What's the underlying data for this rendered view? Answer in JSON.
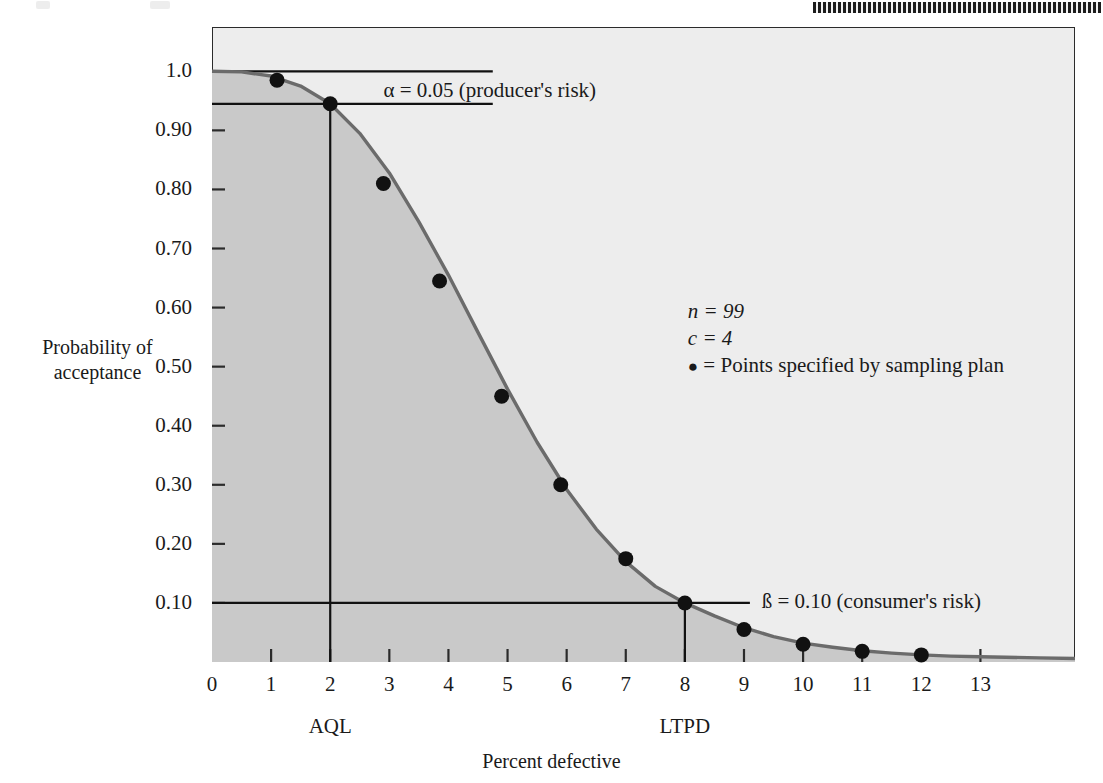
{
  "figure": {
    "axis_title_x": "Percent defective",
    "axis_title_y_line1": "Probability of",
    "axis_title_y_line2": "acceptance"
  },
  "annotations": {
    "alpha": "α = 0.05 (producer's risk)",
    "beta": "ß = 0.10 (consumer's risk)",
    "aql": "AQL",
    "ltpd": "LTPD"
  },
  "legend": {
    "n": "n = 99",
    "c": "c = 4",
    "points_symbol": "●",
    "points_text": "= Points specified by sampling plan"
  },
  "colors": {
    "plot_background": "#ededed",
    "shaded_region": "#c9c9c9",
    "curve": "#6b6b6b",
    "axis": "#2b2b2b",
    "point": "#111111",
    "page_background": "#ffffff"
  },
  "chart_data": {
    "type": "line",
    "title": "",
    "subtitle": "",
    "xlabel": "Percent defective",
    "ylabel": "Probability of acceptance",
    "xlim": [
      0,
      14.6
    ],
    "ylim": [
      0,
      1.075
    ],
    "grid": false,
    "legend_position": "inside-right",
    "xticks": [
      0,
      1,
      2,
      3,
      4,
      5,
      6,
      7,
      8,
      9,
      10,
      11,
      12,
      13
    ],
    "xtick_labels": [
      "0",
      "1",
      "2",
      "3",
      "4",
      "5",
      "6",
      "7",
      "8",
      "9",
      "10",
      "11",
      "12",
      "13"
    ],
    "yticks": [
      0.1,
      0.2,
      0.3,
      0.4,
      0.5,
      0.6,
      0.7,
      0.8,
      0.9,
      1.0
    ],
    "ytick_labels": [
      "0.10",
      "0.20",
      "0.30",
      "0.40",
      "0.50",
      "0.60",
      "0.70",
      "0.80",
      "0.90",
      "1.0"
    ],
    "series": [
      {
        "name": "OC curve",
        "type": "line",
        "x": [
          0,
          0.5,
          1.0,
          1.5,
          2.0,
          2.5,
          3.0,
          3.5,
          4.0,
          4.5,
          5.0,
          5.5,
          6.0,
          6.5,
          7.0,
          7.5,
          8.0,
          8.5,
          9.0,
          9.5,
          10.0,
          10.5,
          11.0,
          11.5,
          12.0,
          12.5,
          13.0,
          14.0,
          14.6
        ],
        "y": [
          1.0,
          0.999,
          0.992,
          0.975,
          0.945,
          0.895,
          0.828,
          0.745,
          0.655,
          0.558,
          0.462,
          0.372,
          0.292,
          0.225,
          0.17,
          0.128,
          0.1,
          0.078,
          0.058,
          0.043,
          0.032,
          0.025,
          0.019,
          0.015,
          0.012,
          0.01,
          0.009,
          0.007,
          0.006
        ]
      },
      {
        "name": "Points specified by sampling plan",
        "type": "scatter",
        "x": [
          1.1,
          2.0,
          2.9,
          3.85,
          4.9,
          5.9,
          7.0,
          8.0,
          9.0,
          10.0,
          11.0,
          12.0
        ],
        "y": [
          0.985,
          0.945,
          0.81,
          0.645,
          0.45,
          0.3,
          0.175,
          0.1,
          0.055,
          0.03,
          0.018,
          0.012
        ]
      }
    ],
    "reference_lines": [
      {
        "name": "probability-1.0-line",
        "orientation": "horizontal",
        "y": 1.0,
        "x_from": 0,
        "x_to": 4.75
      },
      {
        "name": "alpha-line",
        "orientation": "horizontal",
        "y": 0.945,
        "x_from": 0,
        "x_to": 4.75
      },
      {
        "name": "aql-line",
        "orientation": "vertical",
        "x": 2.0,
        "y_from": 0,
        "y_to": 0.945
      },
      {
        "name": "beta-line",
        "orientation": "horizontal",
        "y": 0.1,
        "x_from": 0,
        "x_to": 9.1
      },
      {
        "name": "ltpd-line",
        "orientation": "vertical",
        "x": 8.0,
        "y_from": 0,
        "y_to": 0.1
      }
    ],
    "annotations": [
      {
        "text": "α = 0.05 (producer's risk)",
        "x": 2.9,
        "y": 0.965
      },
      {
        "text": "ß = 0.10 (consumer's risk)",
        "x": 9.3,
        "y": 0.1
      },
      {
        "text": "n = 99",
        "x": 8.1,
        "y": 0.585
      },
      {
        "text": "c = 4",
        "x": 8.1,
        "y": 0.545
      },
      {
        "text": "● = Points specified by sampling plan",
        "x": 8.1,
        "y": 0.505
      },
      {
        "text": "AQL",
        "x": 2.0,
        "y": -0.13
      },
      {
        "text": "LTPD",
        "x": 8.0,
        "y": -0.13
      }
    ],
    "shaded_area": {
      "name": "acceptance-region",
      "under_series": "OC curve",
      "color": "#c9c9c9"
    }
  }
}
